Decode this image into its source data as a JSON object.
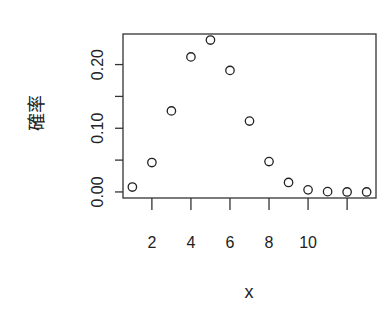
{
  "chart_data": {
    "type": "scatter",
    "title": "",
    "xlabel": "x",
    "ylabel": "確率",
    "x": [
      1,
      2,
      3,
      4,
      5,
      6,
      7,
      8,
      9,
      10,
      11,
      12,
      13
    ],
    "values": [
      0.0077,
      0.0462,
      0.1272,
      0.212,
      0.2385,
      0.1908,
      0.1113,
      0.0477,
      0.0149,
      0.0033,
      0.0005,
      0.0,
      0.0
    ],
    "xlim": [
      0.52,
      13.48
    ],
    "ylim": [
      -0.0095,
      0.248
    ],
    "x_ticks": [
      2,
      4,
      6,
      8,
      10,
      12
    ],
    "x_tick_labels": [
      "2",
      "4",
      "6",
      "8",
      "10",
      ""
    ],
    "y_ticks": [
      0.0,
      0.05,
      0.1,
      0.15,
      0.2
    ],
    "y_tick_labels": [
      "0.00",
      "",
      "0.10",
      "",
      "0.20"
    ],
    "marker": "open-circle",
    "grid": false,
    "legend": null
  }
}
